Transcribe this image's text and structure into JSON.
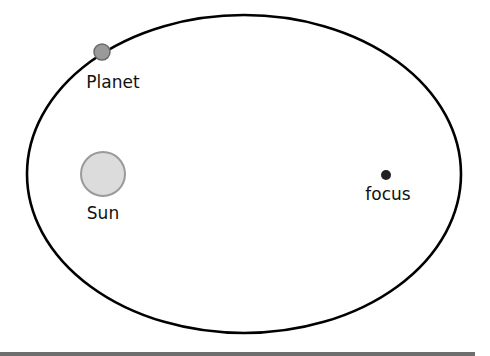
{
  "diagram": {
    "type": "elliptical-orbit",
    "orbit": {
      "cx": 244,
      "cy": 174,
      "rx": 217,
      "ry": 159,
      "stroke": "#000000"
    },
    "planet": {
      "label": "Planet",
      "cx": 102,
      "cy": 52,
      "r": 8,
      "fill": "#9a9a9a",
      "stroke": "#6a6a6a"
    },
    "sun": {
      "label": "Sun",
      "cx": 103,
      "cy": 174,
      "r": 22,
      "fill": "#dcdcdc",
      "stroke": "#9a9a9a"
    },
    "focus": {
      "label": "focus",
      "cx": 386,
      "cy": 175,
      "r": 5,
      "fill": "#222222"
    }
  },
  "colors": {
    "background": "#ffffff",
    "bottom_bar": "#6e6e6e"
  }
}
